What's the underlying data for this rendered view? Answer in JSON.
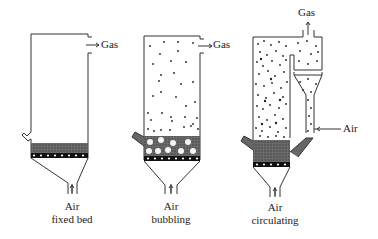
{
  "diagram": {
    "reactors": [
      {
        "id": "fixed-bed",
        "air_label": "Air",
        "type_label": "fixed bed",
        "gas_label": "Gas"
      },
      {
        "id": "bubbling",
        "air_label": "Air",
        "type_label": "bubbling",
        "gas_label": "Gas"
      },
      {
        "id": "circulating",
        "air_label": "Air",
        "type_label": "circulating",
        "gas_label": "Gas",
        "side_air_label": "Air"
      }
    ],
    "colors": {
      "line": "#333333",
      "bed": "#555555",
      "particle": "#222222"
    }
  }
}
